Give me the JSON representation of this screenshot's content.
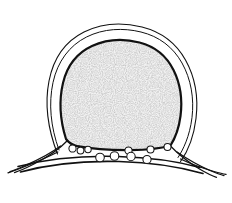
{
  "figure": {
    "kind": "scientific-line-drawing",
    "style": "black-ink-stipple",
    "background_color": "#ffffff",
    "ink_color": "#111111",
    "stipple_color": "#8d8d8d",
    "stipple_base_tint": "#f2f2f2",
    "canvas": {
      "width": 232,
      "height": 203
    },
    "caption": "",
    "title": "",
    "labels": [],
    "axis_text": [],
    "legend": []
  },
  "parts": {
    "outer_envelope": {
      "name": "outer-envelope-outline",
      "description": "thin outer contour enclosing the whole section with a narrow white gap",
      "stroke_width": 1.1,
      "path": "M 57.5 154.0 C 47.5 128.0 44.5 104.0 49.0 81.0 C 53.5 58.0 66.0 41.0 84.0 32.0 C 102.0 23.0 123.0 22.2 142.0 27.0 C 161.0 31.8 176.0 43.0 185.5 60.0 C 195.0 77.0 198.5 98.0 196.0 118.5 C 193.5 139.0 186.0 154.0 180.5 161.5"
    },
    "envelope_inner": {
      "name": "envelope-inner-contour",
      "description": "second thin line just inside the outer envelope",
      "stroke_width": 1.0,
      "path": "M 59.0 150.0 C 50.5 126.5 48.5 103.5 53.0 82.5 C 57.5 61.5 69.5 45.5 86.5 37.0 C 103.5 28.5 123.0 27.6 141.0 32.0 C 159.0 36.4 173.0 47.0 182.0 63.0 C 191.0 79.0 194.3 98.5 192.0 117.5 C 189.7 136.5 183.0 150.0 178.0 157.5"
    },
    "body_outline": {
      "name": "central-body-outline",
      "description": "thick dark contour of the stippled central mass",
      "stroke_width": 2.2,
      "path": "M 66.0 139.0 C 60.0 120.0 59.0 100.0 63.0 83.0 C 67.0 66.0 77.0 53.0 92.0 46.0 C 107.0 39.0 124.0 38.5 139.5 42.5 C 155.0 46.5 166.5 56.0 173.5 70.0 C 180.5 84.0 182.5 100.5 180.5 116.0 C 178.7 130.0 174.0 140.0 170.5 145.5 C 160.0 148.5 146.0 150.0 131.0 150.2 C 112.0 150.4 92.0 149.0 77.5 146.2 C 72.0 145.0 68.5 142.5 66.0 139.0 Z"
    },
    "left_wing": {
      "name": "left-lateral-wing",
      "description": "three lines radiating from the body toward the lower-left margin",
      "strokes": [
        {
          "stroke_width": 1.3,
          "path": "M 57.8 152.0 C 48.0 157.0 34.0 163.0 20.0 168.5 C 14.0 170.8 10.5 172.0 8.0 172.8"
        },
        {
          "stroke_width": 1.2,
          "path": "M 60.5 146.0 C 52.0 152.5 38.0 160.0 24.0 166.0 C 17.5 168.8 13.0 170.6 10.0 171.6"
        },
        {
          "stroke_width": 1.2,
          "path": "M 67.5 140.5 C 60.0 148.5 47.0 157.5 33.0 164.5 C 24.5 168.8 18.0 171.4 14.5 172.6"
        }
      ]
    },
    "right_wing": {
      "name": "right-lateral-wing",
      "description": "three lines radiating from the body toward the lower-right margin",
      "strokes": [
        {
          "stroke_width": 1.3,
          "path": "M 180.5 159.0 C 190.0 163.5 202.0 168.0 214.0 171.5 C 220.0 173.2 223.5 174.0 226.0 174.4"
        },
        {
          "stroke_width": 1.2,
          "path": "M 177.0 152.0 C 186.5 158.5 198.5 165.5 210.0 170.5 C 216.5 173.2 221.0 174.8 224.0 175.6"
        },
        {
          "stroke_width": 1.2,
          "path": "M 170.0 145.5 C 177.5 153.5 188.0 162.0 199.5 169.0 C 207.0 173.4 213.0 176.2 216.5 177.4"
        }
      ]
    },
    "basal_band": {
      "name": "basal-band",
      "description": "long gently curved double line running across the bottom of the section",
      "strokes": [
        {
          "stroke_width": 1.5,
          "path": "M 18.0 166.5 C 45.0 159.5 80.0 155.5 118.0 156.5 C 152.0 157.4 180.0 162.0 200.0 167.5"
        },
        {
          "stroke_width": 1.6,
          "path": "M 20.5 172.0 C 48.0 164.5 82.0 160.5 119.0 161.5 C 153.0 162.4 182.0 167.5 203.0 173.5"
        }
      ]
    },
    "basal_cells": {
      "name": "basal-cell-circles",
      "description": "small open circles (cells) attached beneath the central body and along the basal band",
      "upper_row": [
        {
          "cx": 72.5,
          "cy": 148.5,
          "r": 3.6
        },
        {
          "cx": 80.5,
          "cy": 150.5,
          "r": 3.4
        },
        {
          "cx": 88.0,
          "cy": 149.5,
          "r": 3.2
        },
        {
          "cx": 128.5,
          "cy": 150.5,
          "r": 3.6
        },
        {
          "cx": 150.5,
          "cy": 149.5,
          "r": 3.5
        },
        {
          "cx": 167.5,
          "cy": 147.0,
          "r": 3.5
        }
      ],
      "lower_row": [
        {
          "cx": 100.0,
          "cy": 157.5,
          "r": 4.3
        },
        {
          "cx": 114.5,
          "cy": 156.0,
          "r": 4.3
        },
        {
          "cx": 131.0,
          "cy": 156.5,
          "r": 4.2
        },
        {
          "cx": 147.0,
          "cy": 159.5,
          "r": 4.1
        }
      ]
    }
  }
}
